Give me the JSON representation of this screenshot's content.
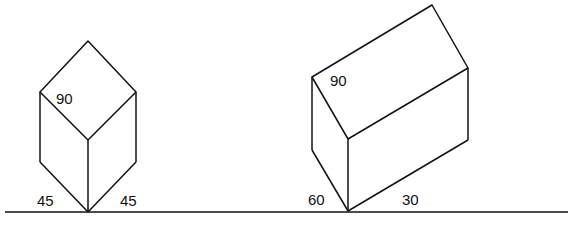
{
  "diagram": {
    "left_figure": {
      "top_angle_label": "90",
      "bottom_left_label": "45",
      "bottom_right_label": "45"
    },
    "right_figure": {
      "top_angle_label": "90",
      "bottom_left_label": "60",
      "bottom_right_label": "30"
    },
    "line_color": "#111111",
    "background": "#ffffff"
  }
}
